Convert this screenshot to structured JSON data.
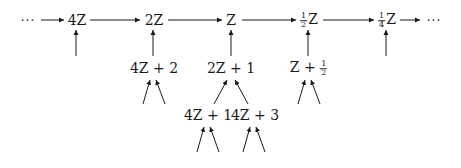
{
  "diagram": {
    "top_row": {
      "left_ellipsis": "···",
      "nodes": [
        {
          "id": "n4Z",
          "label": "4Z"
        },
        {
          "id": "n2Z",
          "label": "2Z"
        },
        {
          "id": "nZ",
          "label": "Z"
        },
        {
          "id": "nhalfZ",
          "num": "1",
          "den": "2",
          "var": "Z"
        },
        {
          "id": "nquarterZ",
          "num": "1",
          "den": "4",
          "var": "Z"
        }
      ],
      "right_ellipsis": "···"
    },
    "second_row": [
      {
        "id": "n4Z2",
        "label": "4Z + 2",
        "parent": "2Z"
      },
      {
        "id": "n2Z1",
        "label": "2Z + 1",
        "parent": "Z"
      },
      {
        "id": "nZhalf",
        "prefix": "Z + ",
        "num": "1",
        "den": "2",
        "parent": "½Z"
      }
    ],
    "third_row": [
      {
        "id": "n4Z1",
        "label": "4Z + 1",
        "parent": "2Z + 1"
      },
      {
        "id": "n4Z3",
        "label": "4Z + 3",
        "parent": "2Z + 1"
      }
    ],
    "arrow_color": "#1a1a1a"
  }
}
